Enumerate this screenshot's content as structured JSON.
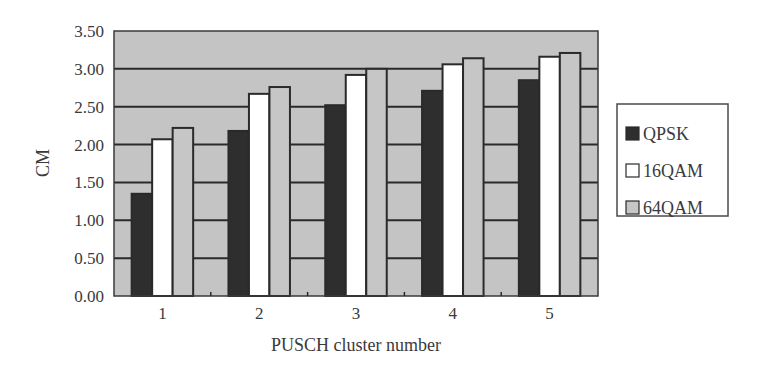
{
  "chart_data": {
    "type": "bar",
    "title": "",
    "xlabel": "PUSCH cluster number",
    "ylabel": "CM",
    "categories": [
      "1",
      "2",
      "3",
      "4",
      "5"
    ],
    "series": [
      {
        "name": "QPSK",
        "color": "#2e2e2e",
        "values": [
          1.35,
          2.18,
          2.52,
          2.71,
          2.85
        ]
      },
      {
        "name": "16QAM",
        "color": "#ffffff",
        "values": [
          2.07,
          2.67,
          2.92,
          3.06,
          3.16
        ]
      },
      {
        "name": "64QAM",
        "color": "#c6c6c6",
        "values": [
          2.22,
          2.76,
          3.0,
          3.14,
          3.21
        ]
      }
    ],
    "ylim": [
      0,
      3.5
    ],
    "yticks": [
      "0.00",
      "0.50",
      "1.00",
      "1.50",
      "2.00",
      "2.50",
      "3.00",
      "3.50"
    ],
    "grid": true,
    "legend_position": "right",
    "plot_background": "#c4c4c4"
  },
  "axis": {
    "x_title": "PUSCH cluster number",
    "y_title": "CM"
  },
  "legend": {
    "items": [
      {
        "label": "QPSK",
        "color": "#2e2e2e"
      },
      {
        "label": "16QAM",
        "color": "#ffffff"
      },
      {
        "label": "64QAM",
        "color": "#c6c6c6"
      }
    ]
  }
}
